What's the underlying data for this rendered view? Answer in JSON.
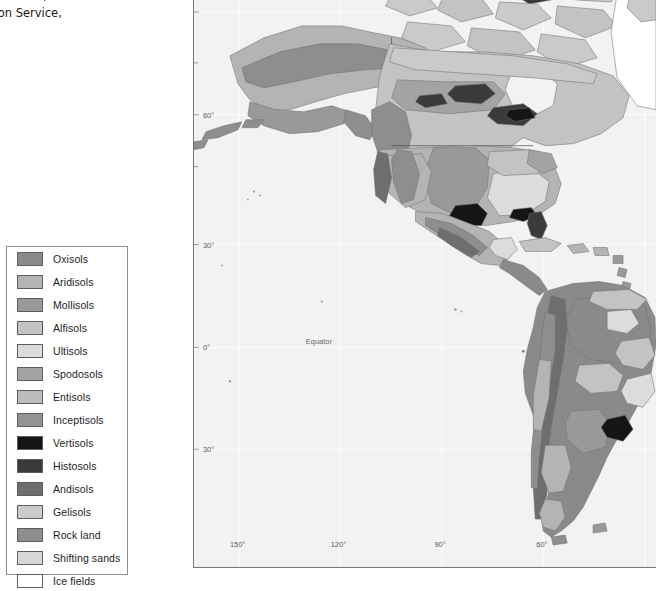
{
  "caption": {
    "text": "il Resources Staff, Natural\nonservation Service,\n.]"
  },
  "legend": {
    "title": "",
    "items": [
      {
        "label": "Oxisols",
        "color": "#8a8a8a"
      },
      {
        "label": "Aridisols",
        "color": "#b4b4b4"
      },
      {
        "label": "Mollisols",
        "color": "#999999"
      },
      {
        "label": "Alfisols",
        "color": "#c3c3c3"
      },
      {
        "label": "Ultisols",
        "color": "#dcdcdc"
      },
      {
        "label": "Spodosols",
        "color": "#a3a3a3"
      },
      {
        "label": "Entisols",
        "color": "#bdbdbd"
      },
      {
        "label": "Inceptisols",
        "color": "#939393"
      },
      {
        "label": "Vertisols",
        "color": "#151515"
      },
      {
        "label": "Histosols",
        "color": "#3a3a3a"
      },
      {
        "label": "Andisols",
        "color": "#6e6e6e"
      },
      {
        "label": "Gelisols",
        "color": "#cacaca"
      },
      {
        "label": "Rock land",
        "color": "#8e8e8e"
      },
      {
        "label": "Shifting sands",
        "color": "#d7d7d7"
      },
      {
        "label": "Ice fields",
        "color": "#ffffff"
      }
    ]
  },
  "map": {
    "background_color": "#f2f2f2",
    "graticule_color": "#ffffff",
    "frame_color": "#777777",
    "equator_label": "Equator",
    "latitude_labels": [
      {
        "text": "60°",
        "y": 155
      },
      {
        "text": "30°",
        "y": 285
      },
      {
        "text": "0°",
        "y": 388
      },
      {
        "text": "30°",
        "y": 490
      }
    ],
    "longitude_labels": [
      {
        "text": "150°",
        "x": 45
      },
      {
        "text": "120°",
        "x": 146
      },
      {
        "text": "90°",
        "x": 248
      },
      {
        "text": "60°",
        "x": 350
      }
    ]
  }
}
